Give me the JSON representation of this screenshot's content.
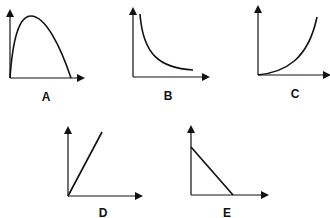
{
  "graphs": [
    {
      "id": "A",
      "label": "A",
      "shape": "inverted parabola (rises to a maximum then falls to zero)"
    },
    {
      "id": "B",
      "label": "B",
      "shape": "inverse / decaying curve (decreasing, approaching x-axis)"
    },
    {
      "id": "C",
      "label": "C",
      "shape": "increasing upward-curving (exponential/quadratic)"
    },
    {
      "id": "D",
      "label": "D",
      "shape": "straight line through origin with positive slope"
    },
    {
      "id": "E",
      "label": "E",
      "shape": "straight line with negative slope from y-intercept to x-intercept"
    }
  ],
  "colors": {
    "ink": "#111111",
    "background": "#ffffff"
  }
}
